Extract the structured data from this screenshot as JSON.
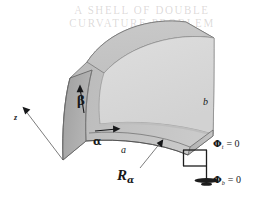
{
  "figure": {
    "kind": "curved-shell-panel-diagram",
    "background_color": "#ffffff",
    "bleed_through_text": "A SHELL OF DOUBLE CURVATURE PROBLEM"
  },
  "shell": {
    "face_color": "#d9d9d9",
    "band_color": "#c4c4c4",
    "top_band_color": "#c8c8c8",
    "side_face_color": "#a9a9a9",
    "outline_color": "#5a5a5a",
    "description": "Doubly curved shell panel drawn in oblique projection"
  },
  "axes": {
    "beta_label": "β",
    "alpha_label": "α",
    "z_label": "z"
  },
  "dimensions": {
    "a_label": "a",
    "b_label": "b",
    "radius_symbol": "R",
    "radius_subscript": "α"
  },
  "boundary_conditions": [
    {
      "id": "phi-t",
      "symbol": "Φ",
      "subscript": "t",
      "relation": "= 0",
      "text": "Φt = 0"
    },
    {
      "id": "phi-b",
      "symbol": "Φ",
      "subscript": "b",
      "relation": "= 0",
      "text": "Φb = 0"
    }
  ],
  "support_symbol": {
    "name": "ground-symbol",
    "color": "#1d1d1d"
  }
}
